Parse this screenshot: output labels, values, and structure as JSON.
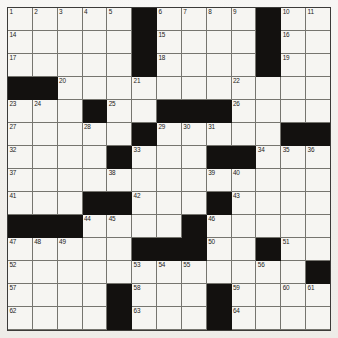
{
  "puzzle": {
    "title": "Crossword Grid",
    "columns": 13,
    "rows": 14,
    "cell_colors": {
      "open": "#f6f5f2",
      "block": "#13110f",
      "grid_line": "#76756f",
      "border": "#3c3b39",
      "number_text": "#232220",
      "paper": "#f1efeb"
    },
    "legend": {
      "open_cell": "open-cell",
      "block_cell": "block-cell"
    },
    "cells": [
      [
        {
          "n": "1",
          "b": false
        },
        {
          "n": "2",
          "b": false
        },
        {
          "n": "3",
          "b": false
        },
        {
          "n": "4",
          "b": false
        },
        {
          "n": "5",
          "b": false
        },
        {
          "n": "",
          "b": true
        },
        {
          "n": "6",
          "b": false
        },
        {
          "n": "7",
          "b": false
        },
        {
          "n": "8",
          "b": false
        },
        {
          "n": "9",
          "b": false
        },
        {
          "n": "",
          "b": true
        },
        {
          "n": "10",
          "b": false
        },
        {
          "n": "11",
          "b": false
        }
      ],
      [
        {
          "n": "14",
          "b": false
        },
        {
          "n": "",
          "b": false
        },
        {
          "n": "",
          "b": false
        },
        {
          "n": "",
          "b": false
        },
        {
          "n": "",
          "b": false
        },
        {
          "n": "",
          "b": true
        },
        {
          "n": "15",
          "b": false
        },
        {
          "n": "",
          "b": false
        },
        {
          "n": "",
          "b": false
        },
        {
          "n": "",
          "b": false
        },
        {
          "n": "",
          "b": true
        },
        {
          "n": "16",
          "b": false
        },
        {
          "n": "",
          "b": false
        }
      ],
      [
        {
          "n": "17",
          "b": false
        },
        {
          "n": "",
          "b": false
        },
        {
          "n": "",
          "b": false
        },
        {
          "n": "",
          "b": false
        },
        {
          "n": "",
          "b": false
        },
        {
          "n": "",
          "b": true
        },
        {
          "n": "18",
          "b": false
        },
        {
          "n": "",
          "b": false
        },
        {
          "n": "",
          "b": false
        },
        {
          "n": "",
          "b": false
        },
        {
          "n": "",
          "b": true
        },
        {
          "n": "19",
          "b": false
        },
        {
          "n": "",
          "b": false
        }
      ],
      [
        {
          "n": "",
          "b": true
        },
        {
          "n": "",
          "b": true
        },
        {
          "n": "20",
          "b": false
        },
        {
          "n": "",
          "b": false
        },
        {
          "n": "",
          "b": false
        },
        {
          "n": "21",
          "b": false
        },
        {
          "n": "",
          "b": false
        },
        {
          "n": "",
          "b": false
        },
        {
          "n": "",
          "b": false
        },
        {
          "n": "22",
          "b": false
        },
        {
          "n": "",
          "b": false
        },
        {
          "n": "",
          "b": false
        },
        {
          "n": "",
          "b": false
        }
      ],
      [
        {
          "n": "23",
          "b": false
        },
        {
          "n": "24",
          "b": false
        },
        {
          "n": "",
          "b": false
        },
        {
          "n": "",
          "b": true
        },
        {
          "n": "25",
          "b": false
        },
        {
          "n": "",
          "b": false
        },
        {
          "n": "",
          "b": true
        },
        {
          "n": "",
          "b": true
        },
        {
          "n": "",
          "b": true
        },
        {
          "n": "26",
          "b": false
        },
        {
          "n": "",
          "b": false
        },
        {
          "n": "",
          "b": false
        },
        {
          "n": "",
          "b": false
        }
      ],
      [
        {
          "n": "27",
          "b": false
        },
        {
          "n": "",
          "b": false
        },
        {
          "n": "",
          "b": false
        },
        {
          "n": "28",
          "b": false
        },
        {
          "n": "",
          "b": false
        },
        {
          "n": "",
          "b": true
        },
        {
          "n": "29",
          "b": false
        },
        {
          "n": "30",
          "b": false
        },
        {
          "n": "31",
          "b": false
        },
        {
          "n": "",
          "b": false
        },
        {
          "n": "",
          "b": false
        },
        {
          "n": "",
          "b": true
        },
        {
          "n": "",
          "b": true
        }
      ],
      [
        {
          "n": "32",
          "b": false
        },
        {
          "n": "",
          "b": false
        },
        {
          "n": "",
          "b": false
        },
        {
          "n": "",
          "b": false
        },
        {
          "n": "",
          "b": true
        },
        {
          "n": "33",
          "b": false
        },
        {
          "n": "",
          "b": false
        },
        {
          "n": "",
          "b": false
        },
        {
          "n": "",
          "b": true
        },
        {
          "n": "",
          "b": true
        },
        {
          "n": "34",
          "b": false
        },
        {
          "n": "35",
          "b": false
        },
        {
          "n": "36",
          "b": false
        }
      ],
      [
        {
          "n": "37",
          "b": false
        },
        {
          "n": "",
          "b": false
        },
        {
          "n": "",
          "b": false
        },
        {
          "n": "",
          "b": false
        },
        {
          "n": "38",
          "b": false
        },
        {
          "n": "",
          "b": false
        },
        {
          "n": "",
          "b": false
        },
        {
          "n": "",
          "b": false
        },
        {
          "n": "39",
          "b": false
        },
        {
          "n": "40",
          "b": false
        },
        {
          "n": "",
          "b": false
        },
        {
          "n": "",
          "b": false
        },
        {
          "n": "",
          "b": false
        }
      ],
      [
        {
          "n": "41",
          "b": false
        },
        {
          "n": "",
          "b": false
        },
        {
          "n": "",
          "b": false
        },
        {
          "n": "",
          "b": true
        },
        {
          "n": "",
          "b": true
        },
        {
          "n": "42",
          "b": false
        },
        {
          "n": "",
          "b": false
        },
        {
          "n": "",
          "b": false
        },
        {
          "n": "",
          "b": true
        },
        {
          "n": "43",
          "b": false
        },
        {
          "n": "",
          "b": false
        },
        {
          "n": "",
          "b": false
        },
        {
          "n": "",
          "b": false
        }
      ],
      [
        {
          "n": "",
          "b": true
        },
        {
          "n": "",
          "b": true
        },
        {
          "n": "",
          "b": true
        },
        {
          "n": "44",
          "b": false
        },
        {
          "n": "45",
          "b": false
        },
        {
          "n": "",
          "b": false
        },
        {
          "n": "",
          "b": false
        },
        {
          "n": "",
          "b": true
        },
        {
          "n": "46",
          "b": false
        },
        {
          "n": "",
          "b": false
        },
        {
          "n": "",
          "b": false
        },
        {
          "n": "",
          "b": false
        },
        {
          "n": "",
          "b": false
        }
      ],
      [
        {
          "n": "47",
          "b": false
        },
        {
          "n": "48",
          "b": false
        },
        {
          "n": "49",
          "b": false
        },
        {
          "n": "",
          "b": false
        },
        {
          "n": "",
          "b": false
        },
        {
          "n": "",
          "b": true
        },
        {
          "n": "",
          "b": true
        },
        {
          "n": "",
          "b": true
        },
        {
          "n": "50",
          "b": false
        },
        {
          "n": "",
          "b": false
        },
        {
          "n": "",
          "b": true
        },
        {
          "n": "51",
          "b": false
        },
        {
          "n": "",
          "b": false
        }
      ],
      [
        {
          "n": "52",
          "b": false
        },
        {
          "n": "",
          "b": false
        },
        {
          "n": "",
          "b": false
        },
        {
          "n": "",
          "b": false
        },
        {
          "n": "",
          "b": false
        },
        {
          "n": "53",
          "b": false
        },
        {
          "n": "54",
          "b": false
        },
        {
          "n": "55",
          "b": false
        },
        {
          "n": "",
          "b": false
        },
        {
          "n": "",
          "b": false
        },
        {
          "n": "56",
          "b": false
        },
        {
          "n": "",
          "b": false
        },
        {
          "n": "",
          "b": true
        }
      ],
      [
        {
          "n": "57",
          "b": false
        },
        {
          "n": "",
          "b": false
        },
        {
          "n": "",
          "b": false
        },
        {
          "n": "",
          "b": false
        },
        {
          "n": "",
          "b": true
        },
        {
          "n": "58",
          "b": false
        },
        {
          "n": "",
          "b": false
        },
        {
          "n": "",
          "b": false
        },
        {
          "n": "",
          "b": true
        },
        {
          "n": "59",
          "b": false
        },
        {
          "n": "",
          "b": false
        },
        {
          "n": "60",
          "b": false
        },
        {
          "n": "61",
          "b": false
        }
      ],
      [
        {
          "n": "62",
          "b": false
        },
        {
          "n": "",
          "b": false
        },
        {
          "n": "",
          "b": false
        },
        {
          "n": "",
          "b": false
        },
        {
          "n": "",
          "b": true
        },
        {
          "n": "63",
          "b": false
        },
        {
          "n": "",
          "b": false
        },
        {
          "n": "",
          "b": false
        },
        {
          "n": "",
          "b": true
        },
        {
          "n": "64",
          "b": false
        },
        {
          "n": "",
          "b": false
        },
        {
          "n": "",
          "b": false
        },
        {
          "n": "",
          "b": false
        }
      ],
      [
        {
          "n": "65",
          "b": false
        },
        {
          "n": "",
          "b": false
        },
        {
          "n": "",
          "b": false
        },
        {
          "n": "",
          "b": false
        },
        {
          "n": "",
          "b": true
        },
        {
          "n": "66",
          "b": false
        },
        {
          "n": "",
          "b": false
        },
        {
          "n": "",
          "b": false
        },
        {
          "n": "",
          "b": true
        },
        {
          "n": "67",
          "b": false
        },
        {
          "n": "",
          "b": false
        },
        {
          "n": "",
          "b": false
        },
        {
          "n": "",
          "b": false
        }
      ]
    ],
    "row_extra": {
      "note": "rows 1-3 and 12-14 widths match 13 columns; row index 0 top-left is clue 1"
    },
    "extra_columns_row0": [
      {
        "n": "12",
        "b": false
      },
      {
        "n": "13",
        "b": false
      }
    ]
  }
}
